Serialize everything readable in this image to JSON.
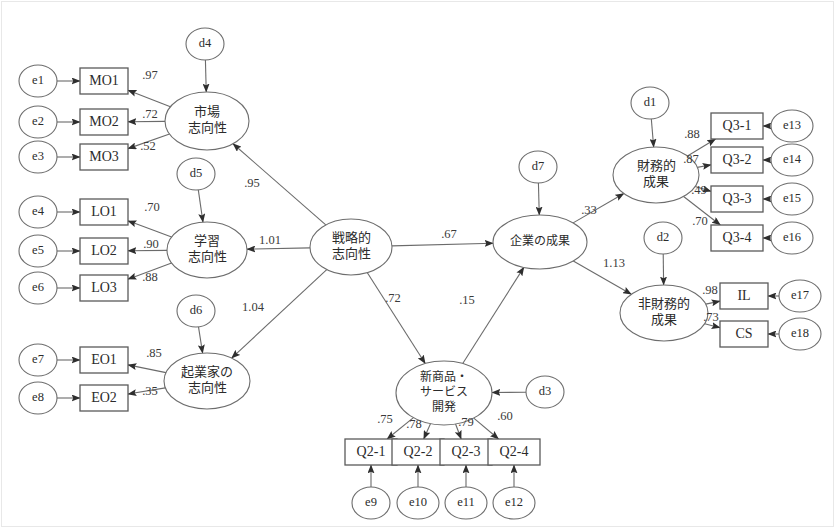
{
  "diagram": {
    "type": "sem-path-diagram",
    "title": "",
    "language": "ja",
    "colors": {
      "node_stroke": "#6d6d6d",
      "rect_stroke": "#5a5a5a",
      "edge_stroke": "#6b6b6b",
      "text": "#2b2b2b",
      "background": "#ffffff",
      "frame": "#e8e8e8"
    },
    "error_terms": [
      {
        "id": "e1",
        "label": "e1",
        "cx": 38,
        "cy": 81
      },
      {
        "id": "e2",
        "label": "e2",
        "cx": 38,
        "cy": 122
      },
      {
        "id": "e3",
        "label": "e3",
        "cx": 38,
        "cy": 157
      },
      {
        "id": "e4",
        "label": "e4",
        "cx": 38,
        "cy": 212
      },
      {
        "id": "e5",
        "label": "e5",
        "cx": 38,
        "cy": 251
      },
      {
        "id": "e6",
        "label": "e6",
        "cx": 38,
        "cy": 288
      },
      {
        "id": "e7",
        "label": "e7",
        "cx": 38,
        "cy": 360
      },
      {
        "id": "e8",
        "label": "e8",
        "cx": 38,
        "cy": 398
      },
      {
        "id": "e9",
        "label": "e9",
        "cx": 371,
        "cy": 503
      },
      {
        "id": "e10",
        "label": "e10",
        "cx": 418,
        "cy": 503
      },
      {
        "id": "e11",
        "label": "e11",
        "cx": 466,
        "cy": 503
      },
      {
        "id": "e12",
        "label": "e12",
        "cx": 514,
        "cy": 503
      },
      {
        "id": "e13",
        "label": "e13",
        "cx": 792,
        "cy": 126
      },
      {
        "id": "e14",
        "label": "e14",
        "cx": 792,
        "cy": 160
      },
      {
        "id": "e15",
        "label": "e15",
        "cx": 792,
        "cy": 199
      },
      {
        "id": "e16",
        "label": "e16",
        "cx": 792,
        "cy": 238
      },
      {
        "id": "e17",
        "label": "e17",
        "cx": 800,
        "cy": 296
      },
      {
        "id": "e18",
        "label": "e18",
        "cx": 800,
        "cy": 334
      }
    ],
    "disturbances": [
      {
        "id": "d1",
        "label": "d1",
        "cx": 650,
        "cy": 103
      },
      {
        "id": "d2",
        "label": "d2",
        "cx": 663,
        "cy": 238
      },
      {
        "id": "d3",
        "label": "d3",
        "cx": 545,
        "cy": 392
      },
      {
        "id": "d4",
        "label": "d4",
        "cx": 205,
        "cy": 44
      },
      {
        "id": "d5",
        "label": "d5",
        "cx": 196,
        "cy": 174
      },
      {
        "id": "d6",
        "label": "d6",
        "cx": 196,
        "cy": 311
      },
      {
        "id": "d7",
        "label": "d7",
        "cx": 538,
        "cy": 167
      }
    ],
    "observed": [
      {
        "id": "MO1",
        "label": "MO1",
        "cx": 104,
        "cy": 81
      },
      {
        "id": "MO2",
        "label": "MO2",
        "cx": 104,
        "cy": 122
      },
      {
        "id": "MO3",
        "label": "MO3",
        "cx": 104,
        "cy": 157
      },
      {
        "id": "LO1",
        "label": "LO1",
        "cx": 104,
        "cy": 212
      },
      {
        "id": "LO2",
        "label": "LO2",
        "cx": 104,
        "cy": 251
      },
      {
        "id": "LO3",
        "label": "LO3",
        "cx": 104,
        "cy": 288
      },
      {
        "id": "EO1",
        "label": "EO1",
        "cx": 104,
        "cy": 360
      },
      {
        "id": "EO2",
        "label": "EO2",
        "cx": 104,
        "cy": 398
      },
      {
        "id": "Q2-1",
        "label": "Q2-1",
        "cx": 371,
        "cy": 452
      },
      {
        "id": "Q2-2",
        "label": "Q2-2",
        "cx": 418,
        "cy": 452
      },
      {
        "id": "Q2-3",
        "label": "Q2-3",
        "cx": 466,
        "cy": 452
      },
      {
        "id": "Q2-4",
        "label": "Q2-4",
        "cx": 514,
        "cy": 452
      },
      {
        "id": "Q3-1",
        "label": "Q3-1",
        "cx": 737,
        "cy": 126
      },
      {
        "id": "Q3-2",
        "label": "Q3-2",
        "cx": 737,
        "cy": 160
      },
      {
        "id": "Q3-3",
        "label": "Q3-3",
        "cx": 737,
        "cy": 199
      },
      {
        "id": "Q3-4",
        "label": "Q3-4",
        "cx": 737,
        "cy": 238
      },
      {
        "id": "IL",
        "label": "IL",
        "cx": 744,
        "cy": 296
      },
      {
        "id": "CS",
        "label": "CS",
        "cx": 744,
        "cy": 334
      }
    ],
    "latents": [
      {
        "id": "MO",
        "lines": [
          "市場",
          "志向性"
        ],
        "cx": 207,
        "cy": 121,
        "rx": 42,
        "ry": 29
      },
      {
        "id": "LO",
        "lines": [
          "学習",
          "志向性"
        ],
        "cx": 207,
        "cy": 250,
        "rx": 40,
        "ry": 28
      },
      {
        "id": "EO",
        "lines": [
          "起業家の",
          "志向性"
        ],
        "cx": 207,
        "cy": 381,
        "rx": 43,
        "ry": 28
      },
      {
        "id": "SO",
        "lines": [
          "戦略的",
          "志向性"
        ],
        "cx": 351,
        "cy": 247,
        "rx": 41,
        "ry": 28
      },
      {
        "id": "NPD",
        "lines": [
          "新商品・",
          "サービス",
          "開発"
        ],
        "cx": 444,
        "cy": 393,
        "rx": 48,
        "ry": 32
      },
      {
        "id": "FP",
        "lines": [
          "企業の成果"
        ],
        "cx": 540,
        "cy": 242,
        "rx": 47,
        "ry": 27
      },
      {
        "id": "FIN",
        "lines": [
          "財務的",
          "成果"
        ],
        "cx": 656,
        "cy": 175,
        "rx": 43,
        "ry": 28
      },
      {
        "id": "NON",
        "lines": [
          "非財務的",
          "成果"
        ],
        "cx": 664,
        "cy": 313,
        "rx": 44,
        "ry": 28
      }
    ],
    "paths": [
      {
        "from": "MO",
        "to": "MO1",
        "value": ".97",
        "lx": 150,
        "ly": 76
      },
      {
        "from": "MO",
        "to": "MO2",
        "value": ".72",
        "lx": 150,
        "ly": 115
      },
      {
        "from": "MO",
        "to": "MO3",
        "value": ".52",
        "lx": 148,
        "ly": 147
      },
      {
        "from": "LO",
        "to": "LO1",
        "value": ".70",
        "lx": 152,
        "ly": 208
      },
      {
        "from": "LO",
        "to": "LO2",
        "value": ".90",
        "lx": 151,
        "ly": 245
      },
      {
        "from": "LO",
        "to": "LO3",
        "value": ".88",
        "lx": 150,
        "ly": 278
      },
      {
        "from": "EO",
        "to": "EO1",
        "value": ".85",
        "lx": 154,
        "ly": 354
      },
      {
        "from": "EO",
        "to": "EO2",
        "value": ".35",
        "lx": 150,
        "ly": 392
      },
      {
        "from": "SO",
        "to": "MO",
        "value": ".95",
        "lx": 252,
        "ly": 184
      },
      {
        "from": "SO",
        "to": "LO",
        "value": "1.01",
        "lx": 270,
        "ly": 241
      },
      {
        "from": "SO",
        "to": "EO",
        "value": "1.04",
        "lx": 253,
        "ly": 308
      },
      {
        "from": "SO",
        "to": "FP",
        "value": ".67",
        "lx": 449,
        "ly": 235
      },
      {
        "from": "SO",
        "to": "NPD",
        "value": ".72",
        "lx": 393,
        "ly": 299
      },
      {
        "from": "NPD",
        "to": "FP",
        "value": ".15",
        "lx": 467,
        "ly": 301
      },
      {
        "from": "FP",
        "to": "FIN",
        "value": ".33",
        "lx": 589,
        "ly": 211
      },
      {
        "from": "FP",
        "to": "NON",
        "value": "1.13",
        "lx": 614,
        "ly": 264
      },
      {
        "from": "FIN",
        "to": "Q3-1",
        "value": ".88",
        "lx": 692,
        "ly": 135
      },
      {
        "from": "FIN",
        "to": "Q3-2",
        "value": ".87",
        "lx": 691,
        "ly": 160
      },
      {
        "from": "FIN",
        "to": "Q3-3",
        "value": ".49",
        "lx": 699,
        "ly": 191
      },
      {
        "from": "FIN",
        "to": "Q3-4",
        "value": ".70",
        "lx": 700,
        "ly": 222
      },
      {
        "from": "NON",
        "to": "IL",
        "value": ".98",
        "lx": 710,
        "ly": 291
      },
      {
        "from": "NON",
        "to": "CS",
        "value": ".73",
        "lx": 711,
        "ly": 318
      },
      {
        "from": "NPD",
        "to": "Q2-1",
        "value": ".75",
        "lx": 385,
        "ly": 420
      },
      {
        "from": "NPD",
        "to": "Q2-2",
        "value": ".78",
        "lx": 414,
        "ly": 425
      },
      {
        "from": "NPD",
        "to": "Q2-3",
        "value": ".79",
        "lx": 466,
        "ly": 423
      },
      {
        "from": "NPD",
        "to": "Q2-4",
        "value": ".60",
        "lx": 505,
        "ly": 417
      }
    ],
    "error_paths": [
      {
        "from": "e1",
        "to": "MO1"
      },
      {
        "from": "e2",
        "to": "MO2"
      },
      {
        "from": "e3",
        "to": "MO3"
      },
      {
        "from": "e4",
        "to": "LO1"
      },
      {
        "from": "e5",
        "to": "LO2"
      },
      {
        "from": "e6",
        "to": "LO3"
      },
      {
        "from": "e7",
        "to": "EO1"
      },
      {
        "from": "e8",
        "to": "EO2"
      },
      {
        "from": "e9",
        "to": "Q2-1"
      },
      {
        "from": "e10",
        "to": "Q2-2"
      },
      {
        "from": "e11",
        "to": "Q2-3"
      },
      {
        "from": "e12",
        "to": "Q2-4"
      },
      {
        "from": "e13",
        "to": "Q3-1"
      },
      {
        "from": "e14",
        "to": "Q3-2"
      },
      {
        "from": "e15",
        "to": "Q3-3"
      },
      {
        "from": "e16",
        "to": "Q3-4"
      },
      {
        "from": "e17",
        "to": "IL"
      },
      {
        "from": "e18",
        "to": "CS"
      }
    ],
    "disturbance_paths": [
      {
        "from": "d4",
        "to": "MO"
      },
      {
        "from": "d5",
        "to": "LO"
      },
      {
        "from": "d6",
        "to": "EO"
      },
      {
        "from": "d7",
        "to": "FP"
      },
      {
        "from": "d1",
        "to": "FIN"
      },
      {
        "from": "d2",
        "to": "NON"
      },
      {
        "from": "d3",
        "to": "NPD"
      }
    ]
  }
}
